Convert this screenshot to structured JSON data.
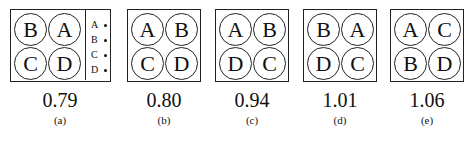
{
  "panels": [
    {
      "id": "a",
      "layout": [
        "B",
        "A",
        "C",
        "D"
      ],
      "value": "0.79",
      "label": "(a)",
      "legend": [
        {
          "letter": "A"
        },
        {
          "letter": "B"
        },
        {
          "letter": "C"
        },
        {
          "letter": "D"
        }
      ]
    },
    {
      "id": "b",
      "layout": [
        "A",
        "B",
        "C",
        "D"
      ],
      "value": "0.80",
      "label": "(b)"
    },
    {
      "id": "c",
      "layout": [
        "A",
        "B",
        "D",
        "C"
      ],
      "value": "0.94",
      "label": "(c)"
    },
    {
      "id": "d",
      "layout": [
        "B",
        "A",
        "D",
        "C"
      ],
      "value": "1.01",
      "label": "(d)"
    },
    {
      "id": "e",
      "layout": [
        "A",
        "C",
        "B",
        "D"
      ],
      "value": "1.06",
      "label": "(e)"
    }
  ]
}
